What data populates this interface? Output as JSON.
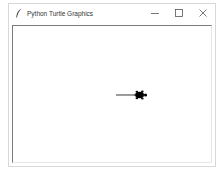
{
  "window": {
    "title": "Python Turtle Graphics",
    "app_icon": "feather-icon",
    "controls": {
      "minimize": "minimize-icon",
      "maximize": "maximize-icon",
      "close": "close-icon"
    }
  },
  "canvas": {
    "background": "#ffffff",
    "pen_color": "#000000",
    "line": {
      "x1": 104,
      "y1": 70,
      "x2": 128,
      "y2": 70
    },
    "turtle": {
      "x": 128,
      "y": 70,
      "heading": 0,
      "shape": "turtle",
      "color": "#000000"
    }
  }
}
